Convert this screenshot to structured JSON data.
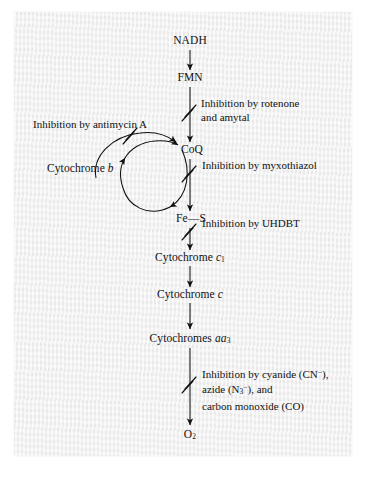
{
  "diagram": {
    "ink_color": "#111111",
    "paper_color": "#efefef",
    "nodes": [
      {
        "id": "nadh",
        "label": "NADH"
      },
      {
        "id": "fmn",
        "label": "FMN"
      },
      {
        "id": "coq",
        "label": "CoQ"
      },
      {
        "id": "cytb",
        "label": "Cytochrome b",
        "italic_part": "b"
      },
      {
        "id": "fes",
        "label": "Fe—S"
      },
      {
        "id": "cytc1",
        "label": "Cytochrome c1",
        "italic_part": "c",
        "subscript": "1"
      },
      {
        "id": "cytc",
        "label": "Cytochrome c",
        "italic_part": "c"
      },
      {
        "id": "cytaa3",
        "label": "Cytochromes aa3",
        "italic_part": "aa",
        "subscript": "3"
      },
      {
        "id": "o2",
        "label": "O2",
        "subscript": "2"
      }
    ],
    "annotations": [
      {
        "id": "rotenone",
        "lines": [
          "Inhibition by rotenone",
          "and amytal"
        ]
      },
      {
        "id": "antimycin",
        "lines": [
          "Inhibition by antimycin A"
        ]
      },
      {
        "id": "myxothiazol",
        "lines": [
          "Inhibition by myxothiazol"
        ]
      },
      {
        "id": "uhdbt",
        "lines": [
          "Inhibition by UHDBT"
        ]
      },
      {
        "id": "cyanide",
        "lines": [
          "Inhibition by cyanide (CN−),",
          "azide (N3−), and",
          "carbon monoxide (CO)"
        ]
      }
    ],
    "inhibition_marks": [
      {
        "id": "mark-rotenone",
        "on": "fmn-to-coq"
      },
      {
        "id": "mark-antimycin",
        "on": "cytb-to-coq"
      },
      {
        "id": "mark-myxothiazol",
        "on": "coq-to-fes"
      },
      {
        "id": "mark-uhdbt",
        "on": "fes-to-cytc1"
      },
      {
        "id": "mark-cyanide",
        "on": "cytaa3-to-o2"
      }
    ]
  },
  "labels": {
    "nadh": "NADH",
    "fmn": "FMN",
    "coq": "CoQ",
    "cytb_word": "Cytochrome",
    "cytb_italic": "b",
    "fes": "Fe—S",
    "cytc1_word": "Cytochrome",
    "cytc1_italic": "c",
    "cytc1_sub": "1",
    "cytc_word": "Cytochrome",
    "cytc_italic": "c",
    "cytaa3_word": "Cytochromes",
    "cytaa3_italic": "aa",
    "cytaa3_sub": "3",
    "o2_word": "O",
    "o2_sub": "2"
  },
  "annotation_text": {
    "rotenone_l1": "Inhibition by rotenone",
    "rotenone_l2": "and amytal",
    "antimycin": "Inhibition by antimycin A",
    "myxothiazol": "Inhibition by myxothiazol",
    "uhdbt": "Inhibition by UHDBT",
    "cyanide_l1a": "Inhibition by cyanide (CN",
    "cyanide_l1sup": "−",
    "cyanide_l1b": "),",
    "cyanide_l2a": "azide (N",
    "cyanide_l2sub": "3",
    "cyanide_l2sup": "−",
    "cyanide_l2b": "), and",
    "cyanide_l3": "carbon monoxide (CO)"
  }
}
